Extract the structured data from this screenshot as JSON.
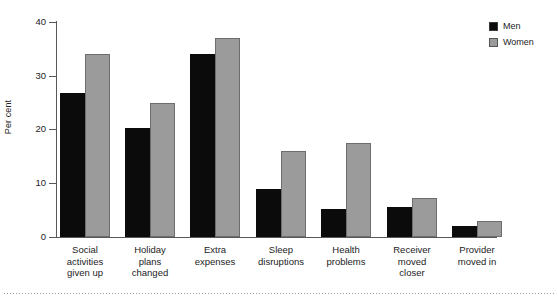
{
  "chart_data": {
    "type": "bar",
    "title": "",
    "subtitle": "",
    "xlabel": "",
    "ylabel": "Per cent",
    "ylim": [
      0,
      40
    ],
    "yticks": [
      0,
      10,
      20,
      30,
      40
    ],
    "ytick_labels": [
      "0",
      "10",
      "20",
      "30",
      "40"
    ],
    "grid": false,
    "legend_position": "top-right",
    "categories": [
      "Social activities given up",
      "Holiday plans changed",
      "Extra expenses",
      "Sleep disruptions",
      "Health problems",
      "Receiver moved closer",
      "Provider moved in"
    ],
    "category_lines": [
      [
        "Social",
        "activities",
        "given up"
      ],
      [
        "Holiday",
        "plans",
        "changed"
      ],
      [
        "Extra",
        "expenses"
      ],
      [
        "Sleep",
        "disruptions"
      ],
      [
        "Health",
        "problems"
      ],
      [
        "Receiver",
        "moved",
        "closer"
      ],
      [
        "Provider",
        "moved in"
      ]
    ],
    "series": [
      {
        "name": "Men",
        "color": "#0b0b0b",
        "values": [
          26.8,
          20.2,
          34.0,
          9.0,
          5.3,
          5.6,
          2.0
        ]
      },
      {
        "name": "Women",
        "color": "#9b9b9b",
        "values": [
          34.1,
          25.0,
          37.0,
          16.0,
          17.4,
          7.2,
          2.9
        ]
      }
    ]
  },
  "legend": {
    "items": [
      {
        "label": "Men",
        "swatch": "men-swatch"
      },
      {
        "label": "Women",
        "swatch": "women-swatch"
      }
    ]
  },
  "axis": {
    "y_title": "Per cent",
    "tick_0": "0",
    "tick_10": "10",
    "tick_20": "20",
    "tick_30": "30",
    "tick_40": "40"
  },
  "colors": {
    "men": "#0b0b0b",
    "women": "#9b9b9b",
    "axis": "#55595c",
    "text": "#1c1c1c",
    "background": "#ffffff"
  }
}
